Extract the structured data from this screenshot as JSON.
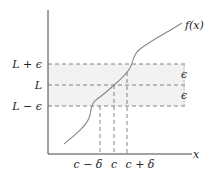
{
  "diagram": {
    "function_label": "f(x)",
    "x_axis_label": "x",
    "y_labels": {
      "upper": "L + ϵ",
      "middle": "L",
      "lower": "L − ϵ"
    },
    "x_labels": {
      "left": "c − δ",
      "center": "c",
      "right": "c + δ"
    },
    "band_labels": {
      "upper_epsilon": "ϵ",
      "lower_epsilon": "ϵ"
    },
    "colors": {
      "axis": "#444444",
      "curve": "#888888",
      "dashed": "#666666",
      "band": "#f2f2f2"
    }
  }
}
